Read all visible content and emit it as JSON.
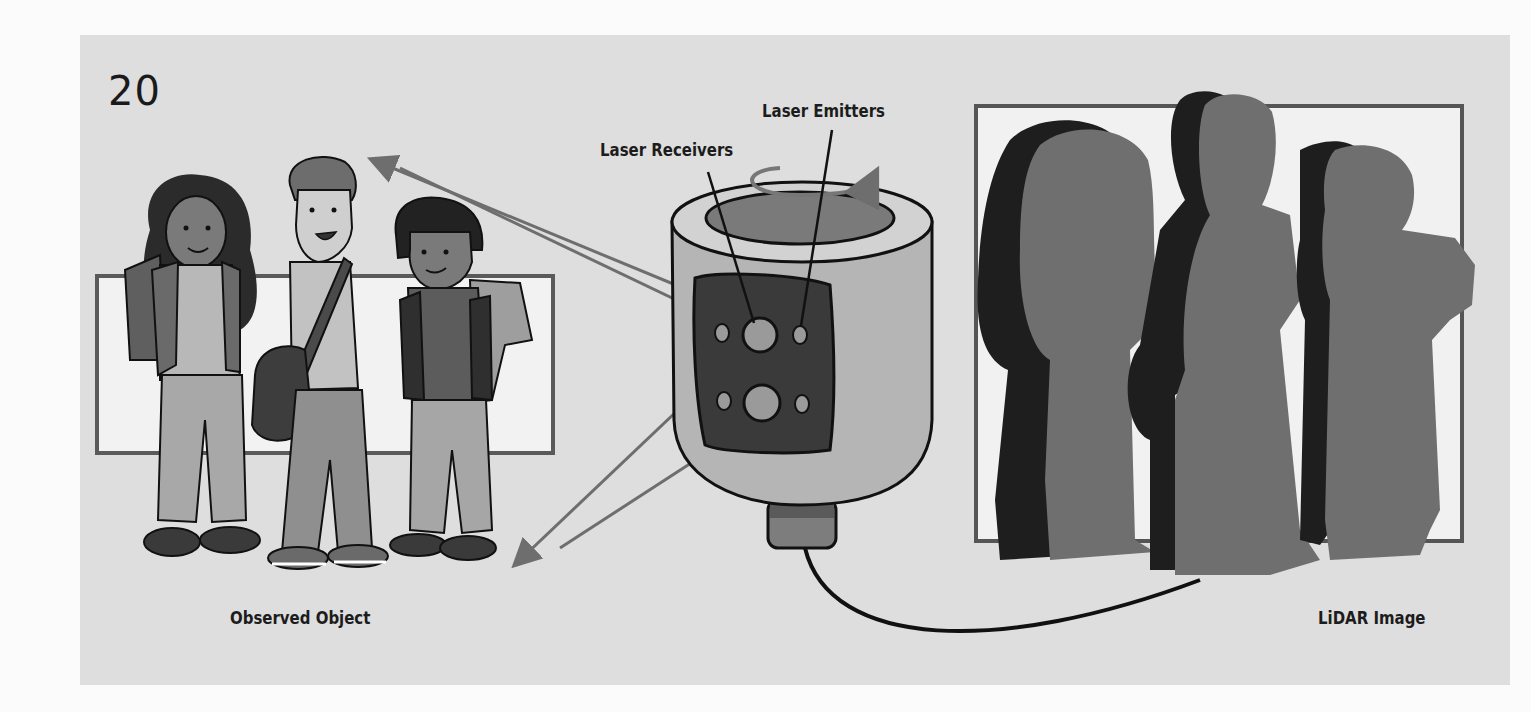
{
  "figure": {
    "number": "20",
    "background": "#dedede",
    "labels": {
      "laser_emitters": "Laser Emitters",
      "laser_receivers": "Laser Receivers",
      "observed_object": "Observed Object",
      "lidar_image": "LiDAR Image"
    },
    "components": {
      "observed_object": {
        "description": "Three cartoon students with backpacks standing in front of a rectangle",
        "people_count": 3
      },
      "lidar_sensor": {
        "description": "Rotating cylindrical LiDAR unit with a window showing emitters and receivers",
        "receivers": 2,
        "emitters": 4
      },
      "lidar_image": {
        "description": "Gray silhouettes of the three students with dark shadow offsets inside a frame",
        "silhouettes": 3
      }
    },
    "colors": {
      "arrow": "#6e6e6e",
      "silhouette": "#6f6f6f",
      "shadow": "#1e1e1e",
      "frame": "#555555",
      "frame_fill": "#f1f1f1"
    }
  }
}
